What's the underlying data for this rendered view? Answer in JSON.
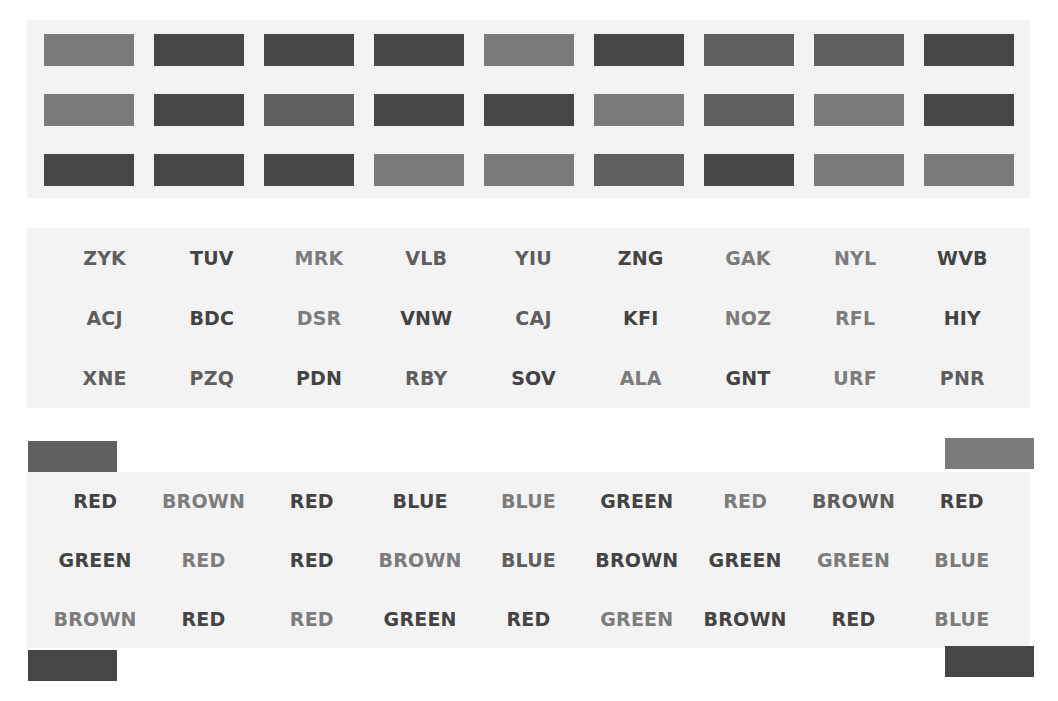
{
  "colors": {
    "panel_bg": "#f3f3f3",
    "light": "#7a7a7a",
    "medium": "#606060",
    "dark": "#464646"
  },
  "bars": [
    [
      "light",
      "dark",
      "dark",
      "dark",
      "light",
      "dark",
      "medium",
      "medium",
      "dark"
    ],
    [
      "light",
      "dark",
      "medium",
      "dark",
      "dark",
      "light",
      "medium",
      "light",
      "dark"
    ],
    [
      "dark",
      "dark",
      "dark",
      "light",
      "light",
      "medium",
      "dark",
      "light",
      "light"
    ]
  ],
  "codes": [
    [
      {
        "text": "ZYK",
        "ink": "medium"
      },
      {
        "text": "TUV",
        "ink": "dark"
      },
      {
        "text": "MRK",
        "ink": "light"
      },
      {
        "text": "VLB",
        "ink": "medium"
      },
      {
        "text": "YIU",
        "ink": "medium"
      },
      {
        "text": "ZNG",
        "ink": "dark"
      },
      {
        "text": "GAK",
        "ink": "light"
      },
      {
        "text": "NYL",
        "ink": "light"
      },
      {
        "text": "WVB",
        "ink": "dark"
      }
    ],
    [
      {
        "text": "ACJ",
        "ink": "medium"
      },
      {
        "text": "BDC",
        "ink": "dark"
      },
      {
        "text": "DSR",
        "ink": "light"
      },
      {
        "text": "VNW",
        "ink": "dark"
      },
      {
        "text": "CAJ",
        "ink": "medium"
      },
      {
        "text": "KFI",
        "ink": "dark"
      },
      {
        "text": "NOZ",
        "ink": "light"
      },
      {
        "text": "RFL",
        "ink": "light"
      },
      {
        "text": "HIY",
        "ink": "dark"
      }
    ],
    [
      {
        "text": "XNE",
        "ink": "medium"
      },
      {
        "text": "PZQ",
        "ink": "medium"
      },
      {
        "text": "PDN",
        "ink": "dark"
      },
      {
        "text": "RBY",
        "ink": "medium"
      },
      {
        "text": "SOV",
        "ink": "dark"
      },
      {
        "text": "ALA",
        "ink": "light"
      },
      {
        "text": "GNT",
        "ink": "dark"
      },
      {
        "text": "URF",
        "ink": "light"
      },
      {
        "text": "PNR",
        "ink": "medium"
      }
    ]
  ],
  "words": [
    [
      {
        "text": "RED",
        "ink": "dark"
      },
      {
        "text": "BROWN",
        "ink": "light"
      },
      {
        "text": "RED",
        "ink": "dark"
      },
      {
        "text": "BLUE",
        "ink": "dark"
      },
      {
        "text": "BLUE",
        "ink": "light"
      },
      {
        "text": "GREEN",
        "ink": "dark"
      },
      {
        "text": "RED",
        "ink": "light"
      },
      {
        "text": "BROWN",
        "ink": "medium"
      },
      {
        "text": "RED",
        "ink": "dark"
      }
    ],
    [
      {
        "text": "GREEN",
        "ink": "dark"
      },
      {
        "text": "RED",
        "ink": "light"
      },
      {
        "text": "RED",
        "ink": "dark"
      },
      {
        "text": "BROWN",
        "ink": "light"
      },
      {
        "text": "BLUE",
        "ink": "medium"
      },
      {
        "text": "BROWN",
        "ink": "dark"
      },
      {
        "text": "GREEN",
        "ink": "dark"
      },
      {
        "text": "GREEN",
        "ink": "light"
      },
      {
        "text": "BLUE",
        "ink": "light"
      }
    ],
    [
      {
        "text": "BROWN",
        "ink": "light"
      },
      {
        "text": "RED",
        "ink": "dark"
      },
      {
        "text": "RED",
        "ink": "light"
      },
      {
        "text": "GREEN",
        "ink": "dark"
      },
      {
        "text": "RED",
        "ink": "dark"
      },
      {
        "text": "GREEN",
        "ink": "light"
      },
      {
        "text": "BROWN",
        "ink": "dark"
      },
      {
        "text": "RED",
        "ink": "dark"
      },
      {
        "text": "BLUE",
        "ink": "light"
      }
    ]
  ],
  "markers": [
    {
      "name": "marker-top-left",
      "left": 28,
      "top": 441,
      "shade": "medium"
    },
    {
      "name": "marker-bottom-left",
      "left": 28,
      "top": 650,
      "shade": "dark"
    },
    {
      "name": "marker-top-right",
      "left": 945,
      "top": 438,
      "shade": "light"
    },
    {
      "name": "marker-bottom-right",
      "left": 945,
      "top": 646,
      "shade": "dark"
    }
  ]
}
